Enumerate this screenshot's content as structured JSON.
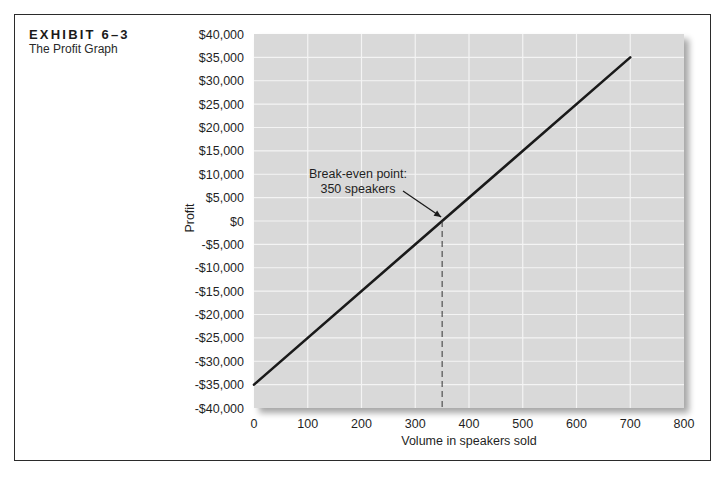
{
  "exhibit": {
    "title": "EXHIBIT 6–3",
    "subtitle": "The Profit Graph"
  },
  "chart_data": {
    "type": "line",
    "title": "The Profit Graph",
    "xlabel": "Volume in speakers sold",
    "ylabel": "Profit",
    "xlim": [
      0,
      800
    ],
    "ylim": [
      -40000,
      40000
    ],
    "x_ticks": [
      0,
      100,
      200,
      300,
      400,
      500,
      600,
      700,
      800
    ],
    "x_tick_labels": [
      "0",
      "100",
      "200",
      "300",
      "400",
      "500",
      "600",
      "700",
      "800"
    ],
    "y_ticks": [
      40000,
      35000,
      30000,
      25000,
      20000,
      15000,
      10000,
      5000,
      0,
      -5000,
      -10000,
      -15000,
      -20000,
      -25000,
      -30000,
      -35000,
      -40000
    ],
    "y_tick_labels": [
      "$40,000",
      "$35,000",
      "$30,000",
      "$25,000",
      "$20,000",
      "$15,000",
      "$10,000",
      "$5,000",
      "$0",
      "-$5,000",
      "-$10,000",
      "-$15,000",
      "-$20,000",
      "-$25,000",
      "-$30,000",
      "-$35,000",
      "-$40,000"
    ],
    "grid": true,
    "series": [
      {
        "name": "Profit",
        "x": [
          0,
          700
        ],
        "y": [
          -35000,
          35000
        ]
      }
    ],
    "annotations": [
      {
        "text_line1": "Break-even point:",
        "text_line2": "350 speakers",
        "x": 350,
        "y": 0
      }
    ],
    "colors": {
      "plot_background": "#d9d9d9",
      "gridline": "#f4f4f4",
      "line": "#1a1a1a",
      "frame": "#2b2b2b"
    }
  }
}
